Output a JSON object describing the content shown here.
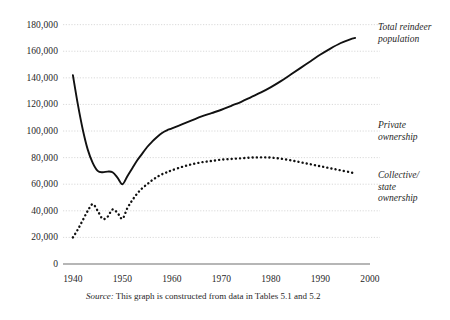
{
  "chart_data": {
    "type": "line",
    "title": "",
    "xlabel": "",
    "ylabel": "",
    "xlim": [
      1938,
      2000
    ],
    "ylim": [
      0,
      185000
    ],
    "grid": true,
    "legend_position": "right-of-plot",
    "y_ticks": [
      "0",
      "20,000",
      "40,000",
      "60,000",
      "80,000",
      "100,000",
      "120,000",
      "140,000",
      "160,000",
      "180,000"
    ],
    "y_tick_values": [
      0,
      20000,
      40000,
      60000,
      80000,
      100000,
      120000,
      140000,
      160000,
      180000
    ],
    "x_ticks": [
      "1940",
      "1950",
      "1960",
      "1970",
      "1980",
      "1990",
      "2000"
    ],
    "x_tick_values": [
      1940,
      1950,
      1960,
      1970,
      1980,
      1990,
      2000
    ],
    "series": [
      {
        "name": "Total reindeer population",
        "style": "solid",
        "color": "#111111",
        "x": [
          1940,
          1941,
          1942,
          1943,
          1944,
          1945,
          1946,
          1947,
          1948,
          1949,
          1950,
          1951,
          1952,
          1953,
          1954,
          1955,
          1956,
          1957,
          1958,
          1959,
          1960,
          1962,
          1964,
          1966,
          1968,
          1970,
          1972,
          1974,
          1976,
          1978,
          1980,
          1982,
          1984,
          1986,
          1988,
          1990,
          1992,
          1994,
          1996,
          1997
        ],
        "values": [
          142000,
          120000,
          101000,
          86000,
          76000,
          70000,
          69000,
          69500,
          69000,
          65000,
          60000,
          66000,
          72000,
          78000,
          83000,
          88000,
          92000,
          95500,
          98500,
          100500,
          102000,
          105000,
          108000,
          111000,
          113500,
          116000,
          119000,
          122000,
          125500,
          129000,
          133000,
          137500,
          142500,
          147500,
          152500,
          157500,
          162000,
          166000,
          169000,
          170000
        ]
      },
      {
        "name": "Collective/ state ownership",
        "style": "dotted",
        "color": "#111111",
        "x": [
          1940,
          1941,
          1942,
          1943,
          1944,
          1945,
          1946,
          1947,
          1948,
          1949,
          1950,
          1951,
          1952,
          1953,
          1954,
          1955,
          1956,
          1957,
          1958,
          1959,
          1960,
          1962,
          1964,
          1966,
          1968,
          1970,
          1972,
          1974,
          1976,
          1978,
          1980,
          1982,
          1984,
          1986,
          1988,
          1990,
          1992,
          1994,
          1996,
          1997
        ],
        "values": [
          20000,
          26000,
          33000,
          40000,
          45000,
          40000,
          34000,
          35500,
          41000,
          38500,
          34000,
          42000,
          48000,
          53000,
          57000,
          60000,
          63000,
          65500,
          67500,
          69000,
          70500,
          73000,
          75000,
          76500,
          77500,
          78500,
          79000,
          79500,
          80000,
          80200,
          80000,
          79200,
          78000,
          76500,
          75000,
          73500,
          72000,
          70500,
          69000,
          68000
        ]
      }
    ],
    "annotations": [
      {
        "label": "Total reindeer population",
        "lines": [
          "Total reindeer",
          "population"
        ]
      },
      {
        "label": "Private ownership",
        "lines": [
          "Private",
          "ownership"
        ]
      },
      {
        "label": "Collective/ state ownership",
        "lines": [
          "Collective/",
          "state",
          "ownership"
        ]
      }
    ]
  },
  "labels": {
    "series_total_line1": "Total reindeer",
    "series_total_line2": "population",
    "series_private_line1": "Private",
    "series_private_line2": "ownership",
    "series_collective_line1": "Collective/",
    "series_collective_line2": "state",
    "series_collective_line3": "ownership"
  },
  "source": {
    "prefix": "Source:",
    "text": " This graph is constructed from data in Tables 5.1 and 5.2"
  }
}
